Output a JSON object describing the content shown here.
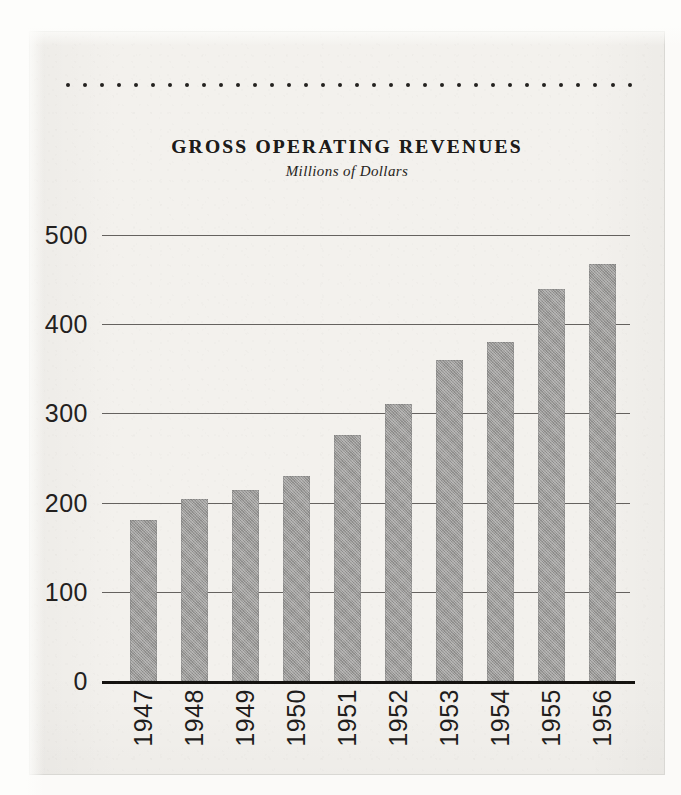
{
  "document": {
    "kind": "scanned-annual-report-figure",
    "page_background": "#f3f1ed",
    "ink_color": "#1d1b19"
  },
  "ornament": {
    "name": "dotted-rule",
    "dot_count": 34,
    "dot_color": "#24221f"
  },
  "heading": {
    "title": "GROSS OPERATING REVENUES",
    "subtitle": "Millions of Dollars"
  },
  "chart_data": {
    "type": "bar",
    "title": "GROSS OPERATING REVENUES",
    "subtitle": "Millions of Dollars",
    "xlabel": "",
    "ylabel": "Millions of Dollars",
    "ylim": [
      0,
      500
    ],
    "yticks": [
      0,
      100,
      200,
      300,
      400,
      500
    ],
    "ytick_labels": [
      "0",
      "100",
      "200",
      "300",
      "400",
      "500"
    ],
    "grid": true,
    "grid_axis": "y",
    "legend": false,
    "bar_color": "#9b9a98",
    "categories": [
      "1947",
      "1948",
      "1949",
      "1950",
      "1951",
      "1952",
      "1953",
      "1954",
      "1955",
      "1956"
    ],
    "values": [
      181,
      204,
      214,
      230,
      276,
      311,
      360,
      380,
      440,
      467
    ],
    "value_units": "millions of dollars",
    "xtick_rotation": 90
  }
}
